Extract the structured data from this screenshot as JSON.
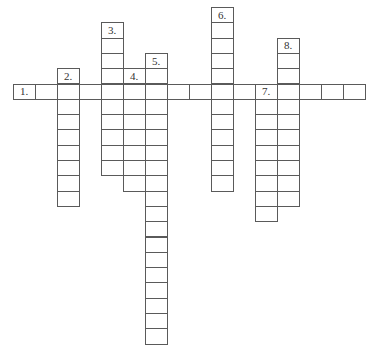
{
  "puzzle": {
    "type": "crossword",
    "cell_width": 22,
    "cell_height": 15.3,
    "origin_x": 12.5,
    "origin_y": 83.5,
    "line_color": "#5a5a5a"
  },
  "entries": [
    {
      "number": "1.",
      "direction": "across",
      "col": 0,
      "row": 0,
      "length": 16
    },
    {
      "number": "2.",
      "direction": "down",
      "col": 2,
      "row": -1,
      "length": 9
    },
    {
      "number": "3.",
      "direction": "down",
      "col": 4,
      "row": -4,
      "length": 10
    },
    {
      "number": "4.",
      "direction": "down",
      "col": 5,
      "row": -1,
      "length": 8
    },
    {
      "number": "5.",
      "direction": "down",
      "col": 6,
      "row": -2,
      "length": 19
    },
    {
      "number": "6.",
      "direction": "down",
      "col": 9,
      "row": -5,
      "length": 12
    },
    {
      "number": "7.",
      "direction": "down",
      "col": 11,
      "row": 0,
      "length": 9
    },
    {
      "number": "8.",
      "direction": "down",
      "col": 12,
      "row": -3,
      "length": 11
    }
  ]
}
